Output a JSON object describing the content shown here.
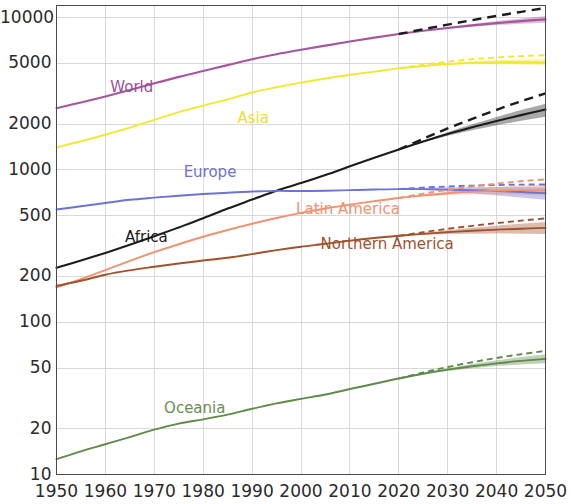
{
  "chart_data": {
    "type": "line",
    "title": "",
    "subtitle": "",
    "xlabel": "",
    "ylabel": "",
    "yscale": "log",
    "xscale": "linear",
    "xlim": [
      1950,
      2050
    ],
    "ylim": [
      10,
      12000
    ],
    "grid": true,
    "legend_position": "inline-annotations",
    "x_tick_labels": [
      "1950",
      "1960",
      "1970",
      "1980",
      "1990",
      "2000",
      "2010",
      "2020",
      "2030",
      "2040",
      "2050"
    ],
    "x_ticks": [
      1950,
      1960,
      1970,
      1980,
      1990,
      2000,
      2010,
      2020,
      2030,
      2040,
      2050
    ],
    "y_tick_labels": [
      "10",
      "20",
      "50",
      "100",
      "200",
      "500",
      "1000",
      "2000",
      "5000",
      "10000"
    ],
    "y_ticks": [
      10,
      20,
      50,
      100,
      200,
      500,
      1000,
      2000,
      5000,
      10000
    ],
    "units": "millions of people",
    "historical_range": [
      1950,
      2020
    ],
    "projection_range": [
      2020,
      2050
    ],
    "x": [
      1950,
      1955,
      1960,
      1965,
      1970,
      1975,
      1980,
      1985,
      1990,
      1995,
      2000,
      2005,
      2010,
      2015,
      2020,
      2025,
      2030,
      2035,
      2040,
      2045,
      2050
    ],
    "series": [
      {
        "name": "World",
        "color": "#a7559c",
        "label_color": "#9c4f93",
        "label_x_year": 1961,
        "label_y_value": 3450,
        "values": [
          2536,
          2773,
          3035,
          3340,
          3700,
          4079,
          4458,
          4871,
          5327,
          5744,
          6143,
          6542,
          6957,
          7380,
          7795,
          8184,
          8549,
          8888,
          9199,
          9482,
          9735
        ],
        "projection_upper": [
          null,
          null,
          null,
          null,
          null,
          null,
          null,
          null,
          null,
          null,
          null,
          null,
          null,
          null,
          7795,
          8230,
          8660,
          9080,
          9480,
          9870,
          10250
        ],
        "projection_lower": [
          null,
          null,
          null,
          null,
          null,
          null,
          null,
          null,
          null,
          null,
          null,
          null,
          null,
          null,
          7795,
          8140,
          8440,
          8700,
          8920,
          9100,
          9240
        ],
        "dashed_high": [
          null,
          null,
          null,
          null,
          null,
          null,
          null,
          null,
          null,
          null,
          null,
          null,
          null,
          null,
          7795,
          8380,
          8990,
          9620,
          10250,
          10900,
          11550
        ]
      },
      {
        "name": "Asia",
        "color": "#f2e82f",
        "label_color": "#ece02b",
        "label_x_year": 1987,
        "label_y_value": 2150,
        "values": [
          1405,
          1542,
          1700,
          1893,
          2130,
          2394,
          2642,
          2904,
          3221,
          3487,
          3741,
          3982,
          4210,
          4420,
          4641,
          4810,
          4947,
          5044,
          5098,
          5110,
          5085
        ],
        "projection_upper": [
          null,
          null,
          null,
          null,
          null,
          null,
          null,
          null,
          null,
          null,
          null,
          null,
          null,
          null,
          4641,
          4845,
          5020,
          5160,
          5260,
          5320,
          5340
        ],
        "projection_lower": [
          null,
          null,
          null,
          null,
          null,
          null,
          null,
          null,
          null,
          null,
          null,
          null,
          null,
          null,
          4641,
          4780,
          4880,
          4930,
          4940,
          4910,
          4840
        ],
        "dashed_high": [
          null,
          null,
          null,
          null,
          null,
          null,
          null,
          null,
          null,
          null,
          null,
          null,
          null,
          null,
          4641,
          4900,
          5130,
          5320,
          5470,
          5580,
          5660
        ]
      },
      {
        "name": "Africa",
        "color": "#1c1c1c",
        "label_color": "#1c1c1c",
        "label_x_year": 1964,
        "label_y_value": 355,
        "values": [
          228,
          254,
          285,
          322,
          366,
          419,
          481,
          557,
          638,
          730,
          819,
          925,
          1055,
          1201,
          1361,
          1536,
          1718,
          1902,
          2093,
          2288,
          2489
        ],
        "projection_upper": [
          null,
          null,
          null,
          null,
          null,
          null,
          null,
          null,
          null,
          null,
          null,
          null,
          null,
          null,
          1361,
          1555,
          1768,
          1990,
          2225,
          2470,
          2720
        ],
        "projection_lower": [
          null,
          null,
          null,
          null,
          null,
          null,
          null,
          null,
          null,
          null,
          null,
          null,
          null,
          null,
          1361,
          1518,
          1672,
          1820,
          1962,
          2100,
          2230
        ],
        "dashed_high": [
          null,
          null,
          null,
          null,
          null,
          null,
          null,
          null,
          null,
          null,
          null,
          null,
          null,
          null,
          1361,
          1600,
          1870,
          2160,
          2480,
          2820,
          3180
        ]
      },
      {
        "name": "Europe",
        "color": "#6d72d6",
        "label_color": "#6d72d6",
        "label_x_year": 1976,
        "label_y_value": 960,
        "values": [
          549,
          577,
          606,
          636,
          657,
          677,
          694,
          707,
          721,
          728,
          726,
          729,
          736,
          743,
          748,
          747,
          742,
          735,
          726,
          715,
          704
        ],
        "projection_upper": [
          null,
          null,
          null,
          null,
          null,
          null,
          null,
          null,
          null,
          null,
          null,
          null,
          null,
          null,
          748,
          760,
          768,
          772,
          773,
          772,
          768
        ],
        "projection_lower": [
          null,
          null,
          null,
          null,
          null,
          null,
          null,
          null,
          null,
          null,
          null,
          null,
          null,
          null,
          748,
          738,
          722,
          702,
          680,
          658,
          636
        ],
        "dashed_high": [
          null,
          null,
          null,
          null,
          null,
          null,
          null,
          null,
          null,
          null,
          null,
          null,
          null,
          null,
          748,
          765,
          778,
          788,
          795,
          800,
          802
        ]
      },
      {
        "name": "Latin America",
        "color": "#ef9272",
        "label_color": "#ef9272",
        "label_x_year": 1999,
        "label_y_value": 545,
        "values": [
          169,
          192,
          220,
          253,
          288,
          325,
          364,
          403,
          443,
          483,
          522,
          558,
          591,
          623,
          654,
          680,
          703,
          720,
          731,
          736,
          733
        ],
        "projection_upper": [
          null,
          null,
          null,
          null,
          null,
          null,
          null,
          null,
          null,
          null,
          null,
          null,
          null,
          null,
          654,
          690,
          722,
          750,
          772,
          790,
          800
        ],
        "projection_lower": [
          null,
          null,
          null,
          null,
          null,
          null,
          null,
          null,
          null,
          null,
          null,
          null,
          null,
          null,
          654,
          672,
          684,
          691,
          692,
          687,
          678
        ],
        "dashed_high": [
          null,
          null,
          null,
          null,
          null,
          null,
          null,
          null,
          null,
          null,
          null,
          null,
          null,
          null,
          654,
          698,
          740,
          778,
          812,
          842,
          866
        ]
      },
      {
        "name": "Northern America",
        "color": "#a0522d",
        "label_color": "#a0522d",
        "label_x_year": 2004,
        "label_y_value": 322,
        "values": [
          173,
          187,
          205,
          219,
          231,
          243,
          254,
          265,
          280,
          297,
          313,
          327,
          343,
          357,
          369,
          380,
          390,
          398,
          405,
          411,
          416
        ],
        "projection_upper": [
          null,
          null,
          null,
          null,
          null,
          null,
          null,
          null,
          null,
          null,
          null,
          null,
          null,
          null,
          369,
          386,
          402,
          417,
          430,
          443,
          455
        ],
        "projection_lower": [
          null,
          null,
          null,
          null,
          null,
          null,
          null,
          null,
          null,
          null,
          null,
          null,
          null,
          null,
          369,
          375,
          379,
          381,
          382,
          381,
          379
        ],
        "dashed_high": [
          null,
          null,
          null,
          null,
          null,
          null,
          null,
          null,
          null,
          null,
          null,
          null,
          null,
          null,
          369,
          390,
          410,
          429,
          447,
          464,
          480
        ]
      },
      {
        "name": "Oceania",
        "color": "#5f8a4a",
        "label_color": "#6b8c55",
        "label_x_year": 1972,
        "label_y_value": 27,
        "values": [
          12.6,
          14.2,
          15.8,
          17.6,
          19.7,
          21.6,
          23.0,
          24.7,
          27.0,
          29.3,
          31.4,
          33.5,
          36.4,
          39.4,
          42.7,
          45.9,
          48.8,
          51.4,
          53.7,
          55.7,
          57.4
        ],
        "projection_upper": [
          null,
          null,
          null,
          null,
          null,
          null,
          null,
          null,
          null,
          null,
          null,
          null,
          null,
          null,
          42.7,
          46.4,
          49.9,
          53.2,
          56.2,
          59.0,
          61.6
        ],
        "projection_lower": [
          null,
          null,
          null,
          null,
          null,
          null,
          null,
          null,
          null,
          null,
          null,
          null,
          null,
          null,
          42.7,
          45.4,
          47.8,
          49.8,
          51.5,
          52.8,
          53.8
        ],
        "dashed_high": [
          null,
          null,
          null,
          null,
          null,
          null,
          null,
          null,
          null,
          null,
          null,
          null,
          null,
          null,
          42.7,
          46.8,
          50.8,
          54.6,
          58.2,
          61.6,
          64.8
        ]
      }
    ]
  },
  "axes": {
    "y_labels": [
      "10000",
      "5000",
      "2000",
      "1000",
      "500",
      "200",
      "100",
      "50",
      "20",
      "10"
    ],
    "x_labels": [
      "1950",
      "1960",
      "1970",
      "1980",
      "1990",
      "2000",
      "2010",
      "2020",
      "2030",
      "2040",
      "2050"
    ]
  },
  "annotations": [
    {
      "text": "World"
    },
    {
      "text": "Asia"
    },
    {
      "text": "Europe"
    },
    {
      "text": "Africa"
    },
    {
      "text": "Latin America"
    },
    {
      "text": "Northern America"
    },
    {
      "text": "Oceania"
    }
  ],
  "style": {
    "background": "#ffffff",
    "grid_color": "#cfcfcf",
    "axis_color": "#4a4a4a",
    "tick_text_color": "#2b2b2b"
  }
}
